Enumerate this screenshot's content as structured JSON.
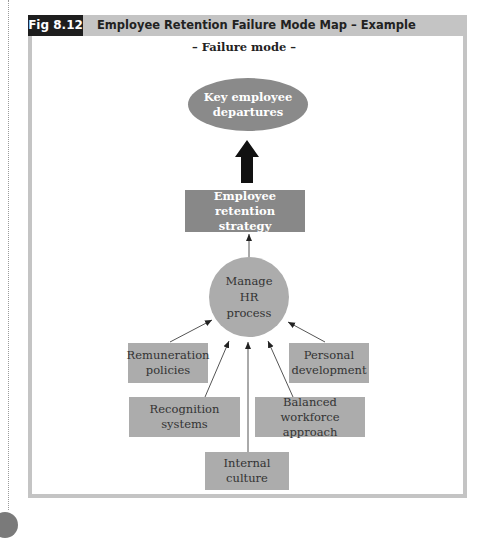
{
  "figure": {
    "label": "Fig 8.12",
    "title": "Employee Retention Failure Mode Map – Example",
    "subtitle": "– Failure mode –"
  },
  "nodes": {
    "failure": {
      "line1": "Key employee",
      "line2": "departures"
    },
    "strategy": {
      "line1": "Employee retention",
      "line2": "strategy"
    },
    "hub": {
      "line1": "Manage",
      "line2": "HR",
      "line3": "process"
    },
    "remuneration": {
      "line1": "Remuneration",
      "line2": "policies"
    },
    "personal": {
      "line1": "Personal",
      "line2": "development"
    },
    "recognition": {
      "line1": "Recognition",
      "line2": "systems"
    },
    "balanced": {
      "line1": "Balanced",
      "line2": "workforce approach"
    },
    "culture": {
      "line1": "Internal",
      "line2": "culture"
    }
  },
  "colors": {
    "frame": "#c4c4c4",
    "label_bg": "#1e1e1e",
    "ellipse": "#8a8a8a",
    "strategy": "#888888",
    "node": "#acacac",
    "arrow": "#111111"
  }
}
